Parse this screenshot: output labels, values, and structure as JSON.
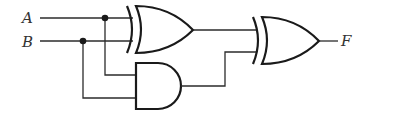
{
  "diagram": {
    "type": "logic-circuit",
    "inputs": [
      {
        "id": "A",
        "label": "A"
      },
      {
        "id": "B",
        "label": "B"
      }
    ],
    "output": {
      "id": "F",
      "label": "F"
    },
    "gates": [
      {
        "id": "xor1",
        "type": "XOR",
        "inputs": [
          "A",
          "B"
        ]
      },
      {
        "id": "and1",
        "type": "AND",
        "inputs": [
          "A",
          "B"
        ]
      },
      {
        "id": "xor2",
        "type": "XOR",
        "inputs": [
          "xor1",
          "and1"
        ],
        "output": "F"
      }
    ],
    "colors": {
      "line": "#2b2b2b",
      "background": "#ffffff"
    }
  }
}
